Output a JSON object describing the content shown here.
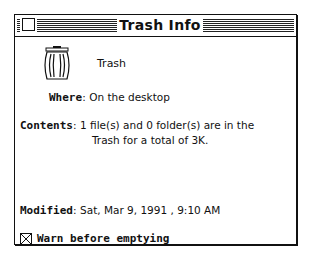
{
  "window": {
    "title": "Trash Info",
    "close_box": "close-box"
  },
  "item": {
    "icon": "trash-can-icon",
    "name": "Trash"
  },
  "info": {
    "where_label": "Where",
    "where_value": "On the desktop",
    "contents_label": "Contents",
    "contents_value_line1": "1 file(s) and 0 folder(s) are in the",
    "contents_value_line2": "Trash for a total of 3K.",
    "modified_label": "Modified",
    "modified_value": "Sat, Mar 9, 1991 , 9:10 AM"
  },
  "options": {
    "warn_label": "Warn before emptying",
    "warn_checked": true
  },
  "separator": ":"
}
